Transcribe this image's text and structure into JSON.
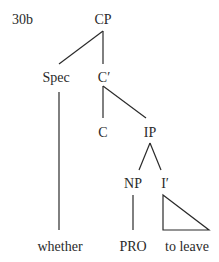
{
  "example_label": "30b",
  "nodes": {
    "cp": "CP",
    "spec": "Spec",
    "c_bar": "C′",
    "c": "C",
    "ip": "IP",
    "np": "NP",
    "i_bar": "I′"
  },
  "terminals": {
    "spec": "whether",
    "np": "PRO",
    "i_bar": "to leave"
  },
  "edges": [
    [
      "CP",
      "Spec"
    ],
    [
      "CP",
      "C′"
    ],
    [
      "C′",
      "C"
    ],
    [
      "C′",
      "IP"
    ],
    [
      "IP",
      "NP"
    ],
    [
      "IP",
      "I′"
    ],
    [
      "Spec",
      "whether"
    ],
    [
      "NP",
      "PRO"
    ],
    [
      "I′",
      "to leave (triangle)"
    ]
  ]
}
